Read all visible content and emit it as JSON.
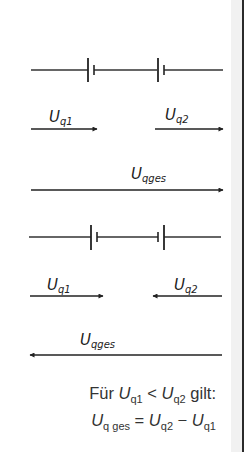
{
  "colors": {
    "ink": "#222222",
    "border": "#2a2a2a",
    "strip": "#f1f1f1",
    "background": "#ffffff"
  },
  "circuit_series_aiding": {
    "battery_1": "Uq1 source, + on left (long plate left)",
    "battery_2": "Uq2 source, + on left (long plate left)",
    "labels": {
      "uq1": {
        "main": "U",
        "sub": "q1"
      },
      "uq2": {
        "main": "U",
        "sub": "q2"
      },
      "uqges": {
        "main": "U",
        "sub": "qges"
      }
    },
    "arrows": {
      "uq1": "right",
      "uq2": "right",
      "uqges": "right"
    }
  },
  "circuit_series_opposing": {
    "battery_1": "Uq1 source, long plate left",
    "battery_2": "Uq2 source reversed, long plate right",
    "labels": {
      "uq1": {
        "main": "U",
        "sub": "q1"
      },
      "uq2": {
        "main": "U",
        "sub": "q2"
      },
      "uqges": {
        "main": "U",
        "sub": "qges"
      }
    },
    "arrows": {
      "uq1": "right",
      "uq2": "left",
      "uqges": "left"
    }
  },
  "caption": {
    "line1": {
      "prefix": "Für ",
      "a_main": "U",
      "a_sub": "q1",
      "op": " < ",
      "b_main": "U",
      "b_sub": "q2",
      "suffix": " gilt:"
    },
    "line2": {
      "lhs_main": "U",
      "lhs_sub": "q ges",
      "eq": " = ",
      "t1_main": "U",
      "t1_sub": "q2",
      "minus": " − ",
      "t2_main": "U",
      "t2_sub": "q1"
    }
  }
}
